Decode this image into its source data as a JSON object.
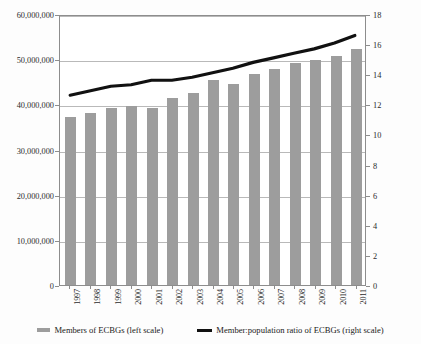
{
  "chart_data": {
    "type": "bar",
    "title": "",
    "subtitle": "",
    "xlabel": "",
    "ylabel": "",
    "categories": [
      "1997",
      "1998",
      "1999",
      "2000",
      "2001",
      "2002",
      "2003",
      "2004",
      "2005",
      "2006",
      "2007",
      "2008",
      "2009",
      "2010",
      "2011"
    ],
    "grid": true,
    "legend_position": "bottom",
    "axes": {
      "left": {
        "label": "Members of ECBGs",
        "ticks": [
          "0",
          "10,000,000",
          "20,000,000",
          "30,000,000",
          "40,000,000",
          "50,000,000",
          "60,000,000"
        ],
        "tick_values": [
          0,
          10000000,
          20000000,
          30000000,
          40000000,
          50000000,
          60000000
        ],
        "ylim": [
          0,
          60000000
        ]
      },
      "right": {
        "label": "Member:population ratio of ECBGs",
        "ticks": [
          "0",
          "2",
          "4",
          "6",
          "8",
          "10",
          "12",
          "14",
          "16",
          "18"
        ],
        "tick_values": [
          0,
          2,
          4,
          6,
          8,
          10,
          12,
          14,
          16,
          18
        ],
        "ylim": [
          0,
          18
        ]
      }
    },
    "series": [
      {
        "name": "Members of ECBGs (left scale)",
        "type": "bar",
        "axis": "left",
        "color": "#9d9d9d",
        "values": [
          37200000,
          38000000,
          39200000,
          39700000,
          39200000,
          41500000,
          42500000,
          45300000,
          44500000,
          46800000,
          47900000,
          49100000,
          49900000,
          50600000,
          52300000
        ]
      },
      {
        "name": "Member:population ratio of ECBGs (right scale)",
        "type": "line",
        "axis": "right",
        "color": "#111111",
        "values": [
          12.7,
          13.0,
          13.3,
          13.4,
          13.7,
          13.7,
          13.9,
          14.2,
          14.5,
          14.9,
          15.2,
          15.5,
          15.8,
          16.2,
          16.7
        ]
      }
    ]
  },
  "legend": {
    "items": [
      {
        "marker": "bar-swatch",
        "label": "Members of ECBGs (left scale)"
      },
      {
        "marker": "line-swatch",
        "label": "Member:population ratio of ECBGs (right scale)"
      }
    ]
  }
}
